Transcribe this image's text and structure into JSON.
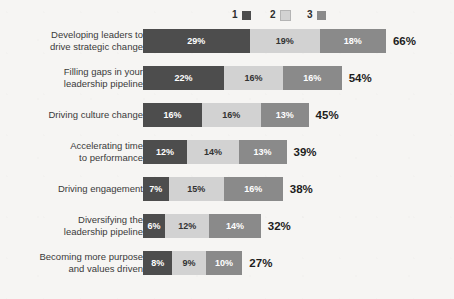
{
  "chart_data": {
    "type": "bar",
    "subtype": "stacked-horizontal",
    "title": "",
    "subtitle": "",
    "xlabel": "",
    "ylabel": "",
    "grid": false,
    "legend_position": "top-center",
    "xlim": [
      0,
      66
    ],
    "value_suffix": "%",
    "legend": [
      {
        "label": "1",
        "color": "#4d4d4d"
      },
      {
        "label": "2",
        "color": "#d2d2d2"
      },
      {
        "label": "3",
        "color": "#8a8a8a"
      }
    ],
    "series": [
      {
        "name": "1",
        "color": "#4d4d4d",
        "values": [
          29,
          22,
          16,
          12,
          7,
          6,
          8
        ]
      },
      {
        "name": "2",
        "color": "#d2d2d2",
        "values": [
          19,
          16,
          16,
          14,
          15,
          12,
          9
        ]
      },
      {
        "name": "3",
        "color": "#8a8a8a",
        "values": [
          18,
          16,
          13,
          13,
          16,
          14,
          10
        ]
      }
    ],
    "categories": [
      "Developing leaders to\ndrive strategic change",
      "Filling gaps in your\nleadership pipeline",
      "Driving culture change",
      "Accelerating time\nto performance",
      "Driving engagement",
      "Diversifying the\nleadership pipeline",
      "Becoming more purpose\nand values driven"
    ],
    "totals": [
      66,
      54,
      45,
      39,
      38,
      32,
      27
    ],
    "rows": [
      {
        "label": "Developing leaders to\ndrive strategic change",
        "segments": [
          {
            "series": "1",
            "value": 29,
            "text": "29%"
          },
          {
            "series": "2",
            "value": 19,
            "text": "19%"
          },
          {
            "series": "3",
            "value": 18,
            "text": "18%"
          }
        ],
        "total": 66,
        "total_text": "66%"
      },
      {
        "label": "Filling gaps in your\nleadership pipeline",
        "segments": [
          {
            "series": "1",
            "value": 22,
            "text": "22%"
          },
          {
            "series": "2",
            "value": 16,
            "text": "16%"
          },
          {
            "series": "3",
            "value": 16,
            "text": "16%"
          }
        ],
        "total": 54,
        "total_text": "54%"
      },
      {
        "label": "Driving culture change",
        "segments": [
          {
            "series": "1",
            "value": 16,
            "text": "16%"
          },
          {
            "series": "2",
            "value": 16,
            "text": "16%"
          },
          {
            "series": "3",
            "value": 13,
            "text": "13%"
          }
        ],
        "total": 45,
        "total_text": "45%"
      },
      {
        "label": "Accelerating time\nto performance",
        "segments": [
          {
            "series": "1",
            "value": 12,
            "text": "12%"
          },
          {
            "series": "2",
            "value": 14,
            "text": "14%"
          },
          {
            "series": "3",
            "value": 13,
            "text": "13%"
          }
        ],
        "total": 39,
        "total_text": "39%"
      },
      {
        "label": "Driving engagement",
        "segments": [
          {
            "series": "1",
            "value": 7,
            "text": "7%"
          },
          {
            "series": "2",
            "value": 15,
            "text": "15%"
          },
          {
            "series": "3",
            "value": 16,
            "text": "16%"
          }
        ],
        "total": 38,
        "total_text": "38%"
      },
      {
        "label": "Diversifying the\nleadership pipeline",
        "segments": [
          {
            "series": "1",
            "value": 6,
            "text": "6%"
          },
          {
            "series": "2",
            "value": 12,
            "text": "12%"
          },
          {
            "series": "3",
            "value": 14,
            "text": "14%"
          }
        ],
        "total": 32,
        "total_text": "32%"
      },
      {
        "label": "Becoming more purpose\nand values driven",
        "segments": [
          {
            "series": "1",
            "value": 8,
            "text": "8%"
          },
          {
            "series": "2",
            "value": 9,
            "text": "9%"
          },
          {
            "series": "3",
            "value": 10,
            "text": "10%"
          }
        ],
        "total": 27,
        "total_text": "27%"
      }
    ]
  },
  "layout": {
    "bar_left_px": 143,
    "px_per_percent": 3.68,
    "bar_height_px": 24,
    "row_pitch_px": 37,
    "first_row_top_px": 29,
    "legend_x_px": [
      232,
      270,
      307
    ],
    "background_color": "#f6f5f3"
  }
}
